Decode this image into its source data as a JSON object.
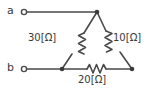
{
  "diagram": {
    "type": "electrical-circuit",
    "topology": "delta-triangle-network",
    "title": "",
    "stroke_color": "#4a4a4a",
    "text_color": "#3a3a3a",
    "background_color": "#ffffff",
    "terminals": [
      {
        "id": "a",
        "label": "a",
        "x": 24,
        "y": 12
      },
      {
        "id": "b",
        "label": "b",
        "x": 24,
        "y": 69
      }
    ],
    "nodes": [
      {
        "id": "apex",
        "x": 97,
        "y": 12
      },
      {
        "id": "bottom-left",
        "x": 62,
        "y": 69
      },
      {
        "id": "bottom-right",
        "x": 132,
        "y": 69
      }
    ],
    "resistors": [
      {
        "id": "r-left",
        "value": "30",
        "unit": "[Ω]",
        "label": "30[Ω]",
        "between": [
          "apex",
          "bottom-left"
        ],
        "orientation": "diagonal"
      },
      {
        "id": "r-right",
        "value": "10",
        "unit": "[Ω]",
        "label": "10[Ω]",
        "between": [
          "apex",
          "bottom-right"
        ],
        "orientation": "diagonal"
      },
      {
        "id": "r-bottom",
        "value": "20",
        "unit": "[Ω]",
        "label": "20[Ω]",
        "between": [
          "bottom-left",
          "bottom-right"
        ],
        "orientation": "horizontal"
      }
    ],
    "wires": [
      {
        "id": "wire-a",
        "from": "terminal-a",
        "to": "apex"
      },
      {
        "id": "wire-b",
        "from": "terminal-b",
        "to": "bottom-left"
      }
    ]
  }
}
